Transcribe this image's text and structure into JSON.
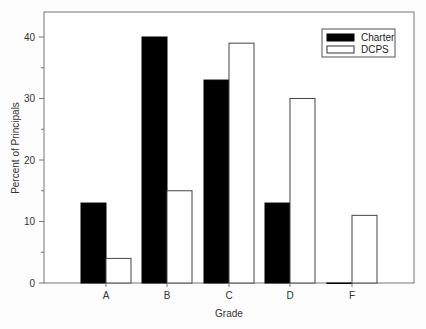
{
  "chart_data": {
    "type": "bar",
    "title": "",
    "xlabel": "Grade",
    "ylabel": "Percent of Principals",
    "categories": [
      "A",
      "B",
      "C",
      "D",
      "F"
    ],
    "series": [
      {
        "name": "Charter",
        "values": [
          13,
          40,
          33,
          13,
          0
        ],
        "fill": "#000000"
      },
      {
        "name": "DCPS",
        "values": [
          4,
          15,
          39,
          30,
          11
        ],
        "fill": "#ffffff"
      }
    ],
    "ylim": [
      0,
      44
    ],
    "yticks": [
      0,
      10,
      20,
      30,
      40
    ],
    "grid": false,
    "legend_position": "top-right"
  },
  "legend": {
    "items": [
      {
        "label": "Charter"
      },
      {
        "label": "DCPS"
      }
    ]
  },
  "axes": {
    "x_title": "Grade",
    "y_title": "Percent of Principals"
  }
}
